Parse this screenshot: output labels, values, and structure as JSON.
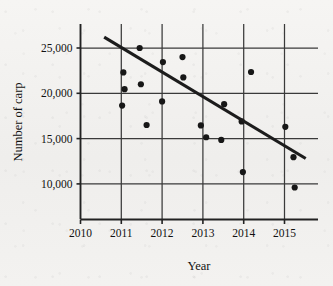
{
  "chart_data": {
    "type": "scatter",
    "title": "",
    "xlabel": "Year",
    "ylabel": "Number of carp",
    "xlim": [
      2009.6,
      2015.85
    ],
    "ylim": [
      6800,
      27600
    ],
    "xticks": [
      2010,
      2011,
      2012,
      2013,
      2014,
      2015
    ],
    "xtick_labels": [
      "2010",
      "2011",
      "2012",
      "2013",
      "2014",
      "2015"
    ],
    "yticks": [
      10000,
      15000,
      20000,
      25000
    ],
    "ytick_labels": [
      "10,000",
      "15,000",
      "20,000",
      "25,000"
    ],
    "grid": "both-major-vertical-and-horizontal",
    "legend": "none",
    "marker": "filled-circle",
    "marker_color": "#171717",
    "points": [
      {
        "x": 2011.05,
        "y": 22300
      },
      {
        "x": 2011.08,
        "y": 20450
      },
      {
        "x": 2011.02,
        "y": 18650
      },
      {
        "x": 2011.45,
        "y": 25000
      },
      {
        "x": 2011.48,
        "y": 21000
      },
      {
        "x": 2011.62,
        "y": 16500
      },
      {
        "x": 2012.0,
        "y": 19100
      },
      {
        "x": 2012.02,
        "y": 23450
      },
      {
        "x": 2012.5,
        "y": 24000
      },
      {
        "x": 2012.52,
        "y": 21750
      },
      {
        "x": 2012.95,
        "y": 16450
      },
      {
        "x": 2013.08,
        "y": 15150
      },
      {
        "x": 2013.45,
        "y": 14850
      },
      {
        "x": 2013.52,
        "y": 18800
      },
      {
        "x": 2013.95,
        "y": 16900
      },
      {
        "x": 2013.98,
        "y": 11300
      },
      {
        "x": 2014.18,
        "y": 22350
      },
      {
        "x": 2015.02,
        "y": 16300
      },
      {
        "x": 2015.22,
        "y": 12950
      },
      {
        "x": 2015.25,
        "y": 9600
      }
    ],
    "trend_line": {
      "x_start": 2010.58,
      "y_start": 26200,
      "x_end": 2015.52,
      "y_end": 12800,
      "color": "#1c1c1c"
    }
  },
  "axes": {
    "x_axis_name": "year-axis",
    "y_axis_name": "carp-count-axis"
  }
}
